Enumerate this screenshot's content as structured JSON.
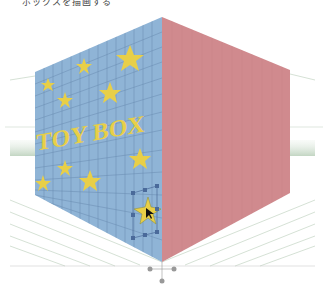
{
  "caption": "ボックスを描画する",
  "scene": {
    "box_label": "TOY BOX",
    "colors": {
      "left_face": "#8fb4d6",
      "left_grid": "#5e81a6",
      "right_face": "#d08a8e",
      "right_grid": "#c07a80",
      "star": "#e8cf48",
      "ground_grid": "#b8cdb8",
      "selection": "#4a6a9a"
    },
    "selected_object": "star",
    "widget": "perspective-grid-widget"
  }
}
